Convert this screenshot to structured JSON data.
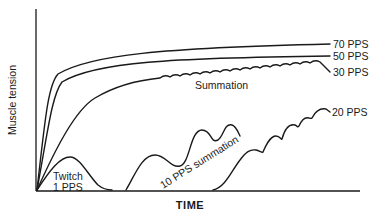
{
  "chart_data": {
    "type": "line",
    "title": "",
    "xlabel": "TIME",
    "ylabel": "Muscle tension",
    "grid": false,
    "legend": "inline labels at line ends",
    "series": [
      {
        "name": "70 PPS",
        "description": "smooth tetanus, highest plateau",
        "path": "M37,190 C45,120 48,85 58,74 C90,55 160,48 330,44"
      },
      {
        "name": "50 PPS",
        "description": "smooth tetanus",
        "path": "M37,190 C48,130 52,95 62,82 C95,62 170,58 330,56"
      },
      {
        "name": "30 PPS",
        "description": "incomplete tetanus with summation ripples",
        "path": "M37,190 C55,150 75,110 95,98 C115,86 140,80 160,78 q5,-4 10,-1 q5,-4 10,-1 q5,-4 10,-1 q5,-4 10,-1 q5,-4 10,-1 q5,-4 10,-1 q5,-4 10,-1 q5,-4 10,-1 q5,-4 10,-1 q5,-4 10,-1 q5,-4 10,-1 q5,-4 10,-1 q5,-4 10,-1 q5,-4 10,-1 q5,-4 10,-1 q5,-4 10,-1 L330,72"
      },
      {
        "name": "Twitch 1 PPS",
        "description": "single twitch",
        "path": "M37,190 C50,170 60,157 70,157 C80,157 88,175 98,185 C103,189 108,190 112,190"
      },
      {
        "name": "10 PPS summation",
        "description": "successive twitches summate",
        "path": "M126,190 C135,175 142,155 155,155 C166,155 170,168 180,166 C190,164 190,130 202,130 C212,130 210,144 218,140 C224,136 224,123 232,125 C236,126 238,132 240,136"
      },
      {
        "name": "20 PPS",
        "description": "summating toward tetanus",
        "path": "M213,190 C225,188 232,170 240,160 C246,152 250,149 256,150 C260,151 261,153 263,152 C266,145 270,136 276,136 C280,136 281,140 282,139 C285,128 290,124 295,125 C298,126 297,128 299,126 C302,119 306,117 309,118 C311,118 311,119 312,118 C315,112 320,108 326,109 L330,112"
      }
    ],
    "labels": [
      {
        "text": "70 PPS",
        "x": 333,
        "y": 48
      },
      {
        "text": "50 PPS",
        "x": 333,
        "y": 60
      },
      {
        "text": "30 PPS",
        "x": 333,
        "y": 76
      },
      {
        "text": "Summation",
        "x": 195,
        "y": 89
      },
      {
        "text": "20 PPS",
        "x": 332,
        "y": 116
      },
      {
        "text": "Twitch",
        "x": 53,
        "y": 180
      },
      {
        "text": "1 PPS",
        "x": 53,
        "y": 191
      },
      {
        "text": "10 PPS summation",
        "x": 163,
        "y": 189,
        "rotate": -32
      }
    ],
    "axes": {
      "x_axis": "M36,191 L360,191",
      "y_axis": "M36,9 L36,191"
    }
  },
  "labels": {
    "l70": "70 PPS",
    "l50": "50 PPS",
    "l30": "30 PPS",
    "summation": "Summation",
    "l20": "20 PPS",
    "twitch": "Twitch",
    "one_pps": "1 PPS",
    "ten_pps": "10 PPS summation",
    "xlabel": "TIME",
    "ylabel": "Muscle tension"
  }
}
